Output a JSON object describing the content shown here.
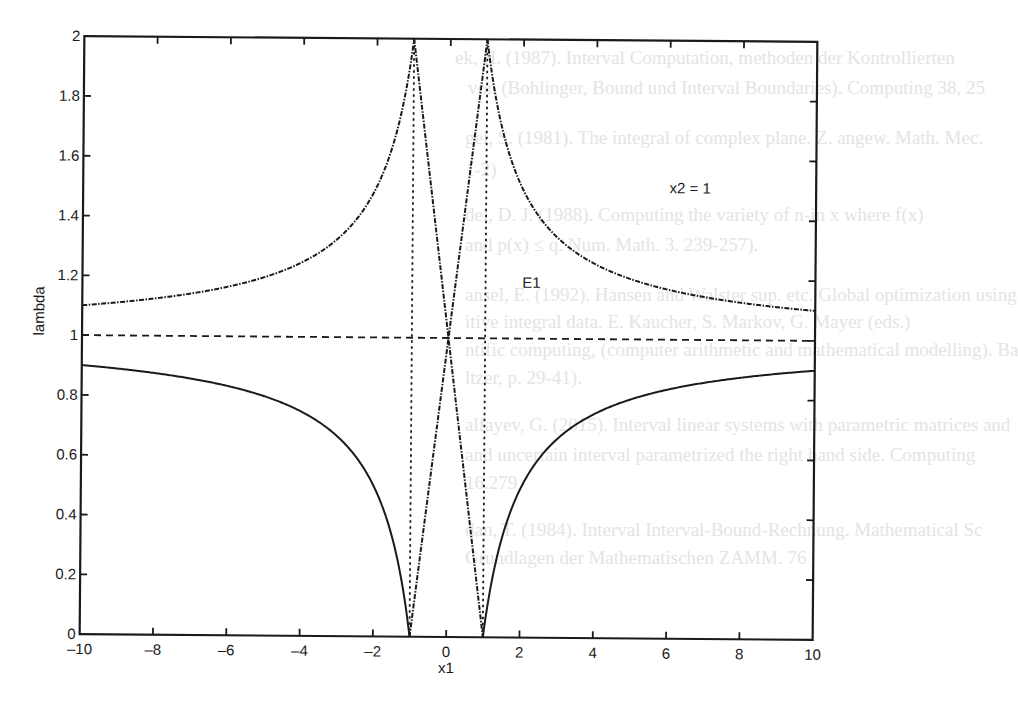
{
  "chart_data": {
    "type": "line",
    "title": "",
    "xlabel": "x1",
    "ylabel": "lambda",
    "xlim": [
      -10,
      10
    ],
    "ylim": [
      0,
      2
    ],
    "grid": false,
    "legend": null,
    "x_ticks": [
      "-10",
      "-8",
      "-6",
      "-4",
      "-2",
      "0",
      "2",
      "4",
      "6",
      "8",
      "10"
    ],
    "y_ticks": [
      "0",
      "0.2",
      "0.4",
      "0.6",
      "0.8",
      "1",
      "1.2",
      "1.4",
      "1.6",
      "1.8",
      "2"
    ],
    "annotations": [
      {
        "text": "x2 = 1",
        "x": 6,
        "y": 1.49
      },
      {
        "text": "E1",
        "x": 2,
        "y": 1.17
      }
    ],
    "series": [
      {
        "name": "upper branch left (dash-dot)",
        "style": "dashdot",
        "x": [
          -10,
          -8,
          -6,
          -4,
          -3,
          -2,
          -1.5,
          -1.2,
          -1
        ],
        "y": [
          1.1,
          1.125,
          1.167,
          1.25,
          1.333,
          1.5,
          1.667,
          1.833,
          2.0
        ]
      },
      {
        "name": "upper branch right (dash-dot)",
        "style": "dashdot",
        "x": [
          1,
          1.2,
          1.5,
          2,
          3,
          4,
          6,
          8,
          10
        ],
        "y": [
          2.0,
          1.833,
          1.667,
          1.5,
          1.333,
          1.25,
          1.167,
          1.125,
          1.1
        ]
      },
      {
        "name": "lower branch left (solid)",
        "style": "solid",
        "x": [
          -10,
          -8,
          -6,
          -4,
          -3,
          -2,
          -1.5,
          -1.2,
          -1
        ],
        "y": [
          0.9,
          0.875,
          0.833,
          0.75,
          0.667,
          0.5,
          0.333,
          0.167,
          0.0
        ]
      },
      {
        "name": "lower branch right (solid)",
        "style": "solid",
        "x": [
          1,
          1.2,
          1.5,
          2,
          3,
          4,
          6,
          8,
          10
        ],
        "y": [
          0.0,
          0.167,
          0.333,
          0.5,
          0.667,
          0.75,
          0.833,
          0.875,
          0.9
        ]
      },
      {
        "name": "inner line 1+x (dash-dot)",
        "style": "dashdot",
        "x": [
          -1,
          0,
          1
        ],
        "y": [
          0.0,
          1.0,
          2.0
        ]
      },
      {
        "name": "inner line 1-x (dash-dot)",
        "style": "dashdot",
        "x": [
          -1,
          0,
          1
        ],
        "y": [
          2.0,
          1.0,
          0.0
        ]
      },
      {
        "name": "asymptote lambda=1 (dashed)",
        "style": "dashed",
        "x": [
          -10,
          10
        ],
        "y": [
          1,
          1
        ]
      },
      {
        "name": "asymptote x1=-1 (dotted)",
        "style": "dotted",
        "x": [
          -1,
          -1
        ],
        "y": [
          0,
          2
        ]
      },
      {
        "name": "asymptote x1=1 (dotted)",
        "style": "dotted",
        "x": [
          1,
          1
        ],
        "y": [
          0,
          2
        ]
      }
    ]
  },
  "ghost_text": [
    "ek, H. (1987). Interval Computation, methoden der Kontrollierten",
    "von (Bohlinger, Bound und Interval Boundaries). Computing 38, 25",
    "gel, S. (1981). The integral of complex plane. Z. angew. Math. Mec.",
    "1-2)",
    "del, D. J. (1988). Computing the variety of n-in x where f(x)",
    "and p(x) ≤ q. Num. Math. 3. 239-257).",
    "ansel, E. (1992). Hansen and Walster sup. etc. Global optimization using",
    "itive integral data. E. Kaucher, S. Markov, G. Mayer (eds.)",
    "ntific computing, (computer arithmetic and mathematical modelling). Ba",
    "ltzer, p. 29-41).",
    "alfayev, G. (2015). Interval linear systems with parametric matrices and",
    "and uncertain interval parametrized the right hand side. Computing",
    "16.279",
    "dan, T. (1984). Interval Interval-Bound-Rechnung. Mathematical Sc",
    "Grundlagen der Mathematischen ZAMM. 76"
  ]
}
